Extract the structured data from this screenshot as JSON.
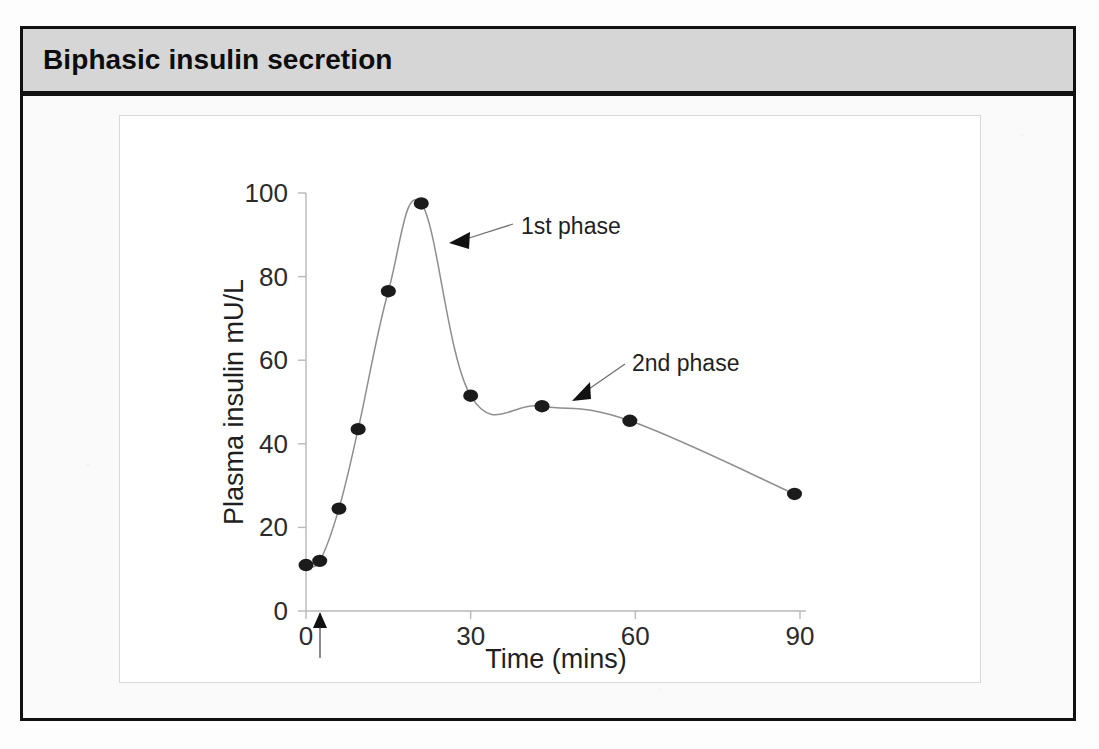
{
  "slide": {
    "title": "Biphasic insulin secretion",
    "title_bar_color": "#d6d6d6",
    "frame_color": "#111111",
    "panel_color": "#ffffff"
  },
  "chart_data": {
    "type": "line",
    "title": "",
    "xlabel": "Time (mins)",
    "ylabel": "Plasma insulin mU/L",
    "xlim": [
      0,
      95
    ],
    "ylim": [
      0,
      100
    ],
    "xticks": [
      0,
      30,
      60,
      90
    ],
    "yticks": [
      0,
      20,
      40,
      60,
      80,
      100
    ],
    "xtick_labels": [
      "0",
      "30",
      "60",
      "90"
    ],
    "ytick_labels": [
      "0",
      "20",
      "40",
      "60",
      "80",
      "100"
    ],
    "grid": false,
    "legend": "none",
    "marker": "filled-circle",
    "marker_color": "#1b1b1b",
    "line_color": "#8e8e8e",
    "series": [
      {
        "name": "Plasma insulin",
        "x": [
          0,
          2.5,
          6,
          9.5,
          15,
          21,
          30,
          43,
          59,
          89
        ],
        "y": [
          11,
          12,
          24.5,
          43.5,
          76.5,
          97.5,
          51.5,
          49,
          45.5,
          28
        ]
      }
    ],
    "annotations": [
      {
        "label": "1st phase",
        "text_x": 39,
        "text_y": 87,
        "point_x": 25.5,
        "point_y": 81
      },
      {
        "label": "2nd phase",
        "text_x": 60,
        "text_y": 60,
        "point_x": 46,
        "point_y": 50
      },
      {
        "label": "glucose-stimulus-arrow",
        "point_x": 2,
        "point_y": 0
      }
    ]
  }
}
